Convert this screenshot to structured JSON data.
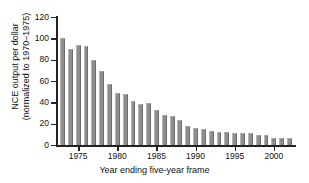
{
  "chart_data": {
    "type": "bar",
    "title": "",
    "xlabel": "Year ending five-year frame",
    "ylabel_line1": "NCE output per dollar",
    "ylabel_line2": "(normalized to 1970–1975)",
    "ylim": [
      0,
      120
    ],
    "yticks": [
      0,
      20,
      40,
      60,
      80,
      100,
      120
    ],
    "ytick_labels": [
      "0",
      "20",
      "40",
      "60",
      "80",
      "100",
      "120"
    ],
    "xlim": [
      1972.3,
      2002.7
    ],
    "xticks": [
      1975,
      1980,
      1985,
      1990,
      1995,
      2000
    ],
    "xtick_labels": [
      "1975",
      "1980",
      "1985",
      "1990",
      "1995",
      "2000"
    ],
    "grid": false,
    "legend": null,
    "bar_color": "#8e8e8e",
    "axis_color": "#222222",
    "categories": [
      1973,
      1974,
      1975,
      1976,
      1977,
      1978,
      1979,
      1980,
      1981,
      1982,
      1983,
      1984,
      1985,
      1986,
      1987,
      1988,
      1989,
      1990,
      1991,
      1992,
      1993,
      1994,
      1995,
      1996,
      1997,
      1998,
      1999,
      2000,
      2001,
      2002
    ],
    "values": [
      100,
      90,
      94,
      93,
      80,
      69,
      57,
      49,
      48,
      41.5,
      38,
      39,
      32.5,
      28,
      27,
      23.5,
      17.5,
      16,
      15,
      13.5,
      12.5,
      12,
      11.5,
      11.5,
      11,
      9.5,
      9,
      7,
      6.5,
      6.5
    ]
  }
}
